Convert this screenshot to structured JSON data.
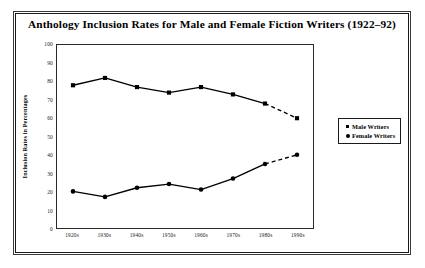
{
  "chart_data": {
    "type": "line",
    "title": "Anthology Inclusion Rates for Male and Female Fiction Writers (1922–92)",
    "xlabel": "",
    "ylabel": "Inclusion Rates in Percentages",
    "categories": [
      "1920s",
      "1930s",
      "1940s",
      "1950s",
      "1960s",
      "1970s",
      "1980s",
      "1990s"
    ],
    "series": [
      {
        "name": "Male Writers",
        "marker": "square",
        "values": [
          78,
          82,
          77,
          74,
          77,
          73,
          68,
          60
        ],
        "dashed_from_index": 6
      },
      {
        "name": "Female Writers",
        "marker": "circle",
        "values": [
          20,
          17,
          22,
          24,
          21,
          27,
          35,
          40
        ],
        "dashed_from_index": 6
      }
    ],
    "ylim": [
      0,
      100
    ],
    "ytick_step": 10,
    "yticks": [
      "100",
      "90",
      "80",
      "70",
      "60",
      "50",
      "40",
      "30",
      "20",
      "10",
      "0"
    ],
    "grid": false,
    "legend_position": "right",
    "line_color": "#000000",
    "frame_color": "#2a2a2a"
  },
  "legend": {
    "entries": [
      {
        "label": "Male Writers",
        "marker": "square"
      },
      {
        "label": "Female Writers",
        "marker": "circle"
      }
    ]
  }
}
